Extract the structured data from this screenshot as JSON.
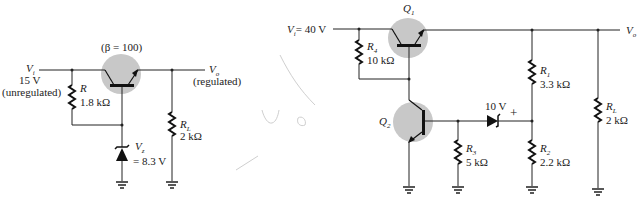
{
  "circuit_left": {
    "input_label": "V",
    "input_sub": "i",
    "input_value": "15 V",
    "input_note": "(unregulated)",
    "transistor_param": "(β = 100)",
    "resistor_name": "R",
    "resistor_value": "1.8  kΩ",
    "load_name": "R",
    "load_sub": "L",
    "load_value": "2 kΩ",
    "zener_name": "V",
    "zener_sub": "z",
    "zener_value": "= 8.3 V",
    "output_label": "V",
    "output_sub": "o",
    "output_note": "(regulated)"
  },
  "circuit_right": {
    "input_label": "V",
    "input_sub": "i",
    "input_value": "= 40 V",
    "q1_name": "Q",
    "q1_sub": "1",
    "q2_name": "Q",
    "q2_sub": "2",
    "r4_name": "R",
    "r4_sub": "4",
    "r4_value": "10 kΩ",
    "r3_name": "R",
    "r3_sub": "3",
    "r3_value": "5 kΩ",
    "r1_name": "R",
    "r1_sub": "1",
    "r1_value": "3.3 kΩ",
    "r2_name": "R",
    "r2_sub": "2",
    "r2_value": "2.2 kΩ",
    "rl_name": "R",
    "rl_sub": "L",
    "rl_value": "2 kΩ",
    "zener_value": "10 V",
    "zener_polarity": "+",
    "output_label": "V",
    "output_sub": "o"
  },
  "colors": {
    "transistor_highlight": "#c8c8c8",
    "wire": "#222222"
  }
}
